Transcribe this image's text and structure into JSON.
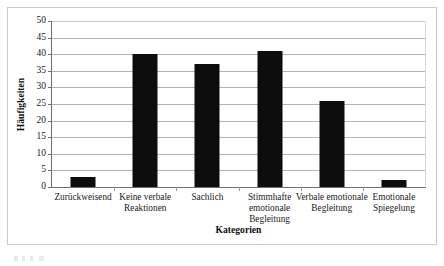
{
  "chart_data": {
    "type": "bar",
    "title": "",
    "xlabel": "Kategorien",
    "ylabel": "Häufigkeiten",
    "categories": [
      "Zurückweisend",
      "Keine verbale Reaktionen",
      "Sachlich",
      "Stimmhafte emotionale Begleitung",
      "Verbale emotionale Begleitung",
      "Emotionale Spiegelung"
    ],
    "values": [
      3,
      40,
      37,
      41,
      26,
      2
    ],
    "ylim": [
      0,
      50
    ],
    "ytick_step": 5,
    "yticks": [
      "50",
      "45",
      "40",
      "35",
      "30",
      "25",
      "20",
      "15",
      "10",
      "5",
      "0"
    ],
    "grid": true,
    "legend": false,
    "bar_color": "#0d0d0d",
    "gridline_color": "#b4b4b4",
    "axis_color": "#6e6e6e",
    "frame_color": "#c9c9c9",
    "background": "#ffffff"
  }
}
